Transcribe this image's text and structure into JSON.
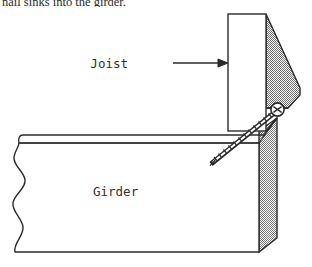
{
  "page": {
    "background_color": "#ffffff",
    "caption": "nail sinks into the girder."
  },
  "figure": {
    "name": "joist-to-girder-screw-connection",
    "labels": {
      "joist": "Joist",
      "girder": "Girder"
    },
    "colors": {
      "outline": "#2b2b2b",
      "hatch_fill": "#8c8c8c",
      "face_fill": "#ffffff",
      "text": "#333333",
      "fastener": "#2b2b2b"
    },
    "parts": [
      {
        "name": "joist",
        "description": "vertical board, front face white rectangle with stippled gray side face"
      },
      {
        "name": "girder",
        "description": "horizontal beam with wavy break line at left and stippled gray end face at right"
      },
      {
        "name": "screw",
        "description": "threaded fastener with round head, driven diagonally down-left from joist side face into girder"
      },
      {
        "name": "leader-arrow",
        "description": "horizontal arrow from Joist label pointing right to the joist"
      }
    ]
  }
}
